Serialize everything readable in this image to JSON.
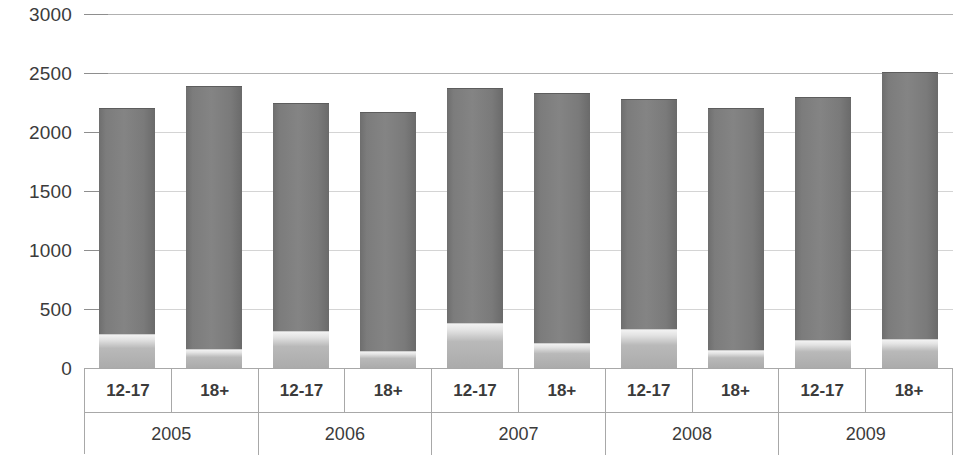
{
  "chart_data": {
    "type": "bar",
    "stacked": true,
    "title": "",
    "xlabel": "",
    "ylabel": "",
    "ylim": [
      0,
      3000
    ],
    "ytick_step": 500,
    "ytick_labels": [
      "3000",
      "2500",
      "2000",
      "1500",
      "1000",
      "500",
      "0"
    ],
    "ytick_values": [
      3000,
      2500,
      2000,
      1500,
      1000,
      500,
      0
    ],
    "grid": true,
    "legend": "none",
    "group_labels": [
      "2005",
      "2006",
      "2007",
      "2008",
      "2009"
    ],
    "categories": [
      "2005 12-17",
      "2005 18+",
      "2006 12-17",
      "2006 18+",
      "2007 12-17",
      "2007 18+",
      "2008 12-17",
      "2008 18+",
      "2009 12-17",
      "2009 18+"
    ],
    "subgroup_labels": [
      "12-17",
      "18+",
      "12-17",
      "18+",
      "12-17",
      "18+",
      "12-17",
      "18+",
      "12-17",
      "18+"
    ],
    "series": [
      {
        "name": "lower-segment",
        "color": "#b9b9b9",
        "values": [
          290,
          160,
          310,
          145,
          380,
          210,
          330,
          150,
          240,
          245
        ]
      },
      {
        "name": "upper-segment",
        "color": "#7c7c7c",
        "values": [
          1910,
          2230,
          1940,
          2025,
          1995,
          2120,
          1950,
          2055,
          2055,
          2260
        ]
      }
    ],
    "totals": [
      2200,
      2390,
      2250,
      2170,
      2375,
      2330,
      2280,
      2205,
      2295,
      2505
    ]
  },
  "colors": {
    "upper_segment": "#7c7c7c",
    "lower_segment": "#b9b9b9",
    "gridline": "#c9c9c9",
    "axis_line": "#a8a8a8",
    "text": "#3b3b3b",
    "background": "#ffffff"
  }
}
